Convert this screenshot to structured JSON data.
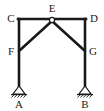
{
  "diagram": {
    "type": "structural-frame",
    "stroke_color": "#1a1a1a",
    "background_color": "#ffffff",
    "joint_fill_color": "#ffffff",
    "labels": {
      "A": "A",
      "B": "B",
      "C": "C",
      "D": "D",
      "E": "E",
      "F": "F",
      "G": "G"
    },
    "nodes": [
      {
        "id": "A",
        "label": "A",
        "x": 19,
        "y": 86,
        "role": "pinned-support-base"
      },
      {
        "id": "B",
        "label": "B",
        "x": 85,
        "y": 86,
        "role": "pinned-support-base"
      },
      {
        "id": "C",
        "label": "C",
        "x": 19,
        "y": 19,
        "role": "corner-joint"
      },
      {
        "id": "D",
        "label": "D",
        "x": 85,
        "y": 19,
        "role": "corner-joint"
      },
      {
        "id": "E",
        "label": "E",
        "x": 52,
        "y": 20,
        "role": "pin-joint"
      },
      {
        "id": "F",
        "label": "F",
        "x": 19,
        "y": 50,
        "role": "brace-joint"
      },
      {
        "id": "G",
        "label": "G",
        "x": 85,
        "y": 50,
        "role": "brace-joint"
      }
    ],
    "members": [
      {
        "id": "AC",
        "from": "A",
        "to": "C",
        "kind": "column"
      },
      {
        "id": "BD",
        "from": "B",
        "to": "D",
        "kind": "column"
      },
      {
        "id": "CE",
        "from": "C",
        "to": "E",
        "kind": "beam"
      },
      {
        "id": "ED",
        "from": "E",
        "to": "D",
        "kind": "beam"
      },
      {
        "id": "FE",
        "from": "F",
        "to": "E",
        "kind": "diagonal-brace"
      },
      {
        "id": "EG",
        "from": "E",
        "to": "G",
        "kind": "diagonal-brace"
      }
    ],
    "supports": [
      {
        "at": "A",
        "kind": "pinned",
        "hatched": true
      },
      {
        "at": "B",
        "kind": "pinned",
        "hatched": true
      }
    ]
  }
}
